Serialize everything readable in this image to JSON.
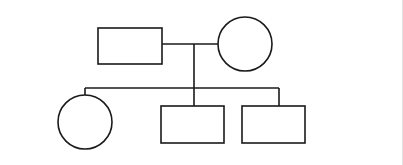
{
  "diagram": {
    "type": "pedigree",
    "stroke_color": "#1a1a1a",
    "stroke_width": 1.6,
    "background": "#ffffff",
    "parents": {
      "father": {
        "shape": "square",
        "sex": "male",
        "x": 98,
        "y": 28,
        "w": 64,
        "h": 36
      },
      "mother": {
        "shape": "circle",
        "sex": "female",
        "cx": 245,
        "cy": 44,
        "r": 27
      },
      "mating_line": {
        "x1": 162,
        "y1": 44,
        "x2": 218,
        "y2": 44
      },
      "descent_line": {
        "x1": 194,
        "y1": 44,
        "x2": 194,
        "y2": 88
      }
    },
    "sibship_line": {
      "x1": 85,
      "y1": 88,
      "x2": 279,
      "y2": 88
    },
    "children": [
      {
        "shape": "circle",
        "sex": "female",
        "cx": 85,
        "cy": 122,
        "r": 27,
        "drop": {
          "x": 85,
          "y1": 88,
          "y2": 95
        }
      },
      {
        "shape": "square",
        "sex": "male",
        "x": 161,
        "y": 106,
        "w": 63,
        "h": 37,
        "drop": {
          "x": 194,
          "y1": 88,
          "y2": 106
        }
      },
      {
        "shape": "square",
        "sex": "male",
        "x": 242,
        "y": 106,
        "w": 63,
        "h": 37,
        "drop": {
          "x": 279,
          "y1": 88,
          "y2": 106
        }
      }
    ]
  }
}
